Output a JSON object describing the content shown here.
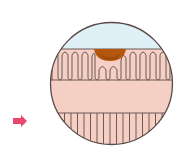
{
  "diagram": {
    "type": "tissue-cross-section-magnified",
    "colors": {
      "background": "#ffffff",
      "lumen": "#dff0f6",
      "tissue": "#f6cfc4",
      "outline": "#6b5a58",
      "lesion": "#b5560f",
      "lesion_dark": "#8a3f0a",
      "arrow": "#e8486e"
    },
    "circle": {
      "cx": 111.5,
      "cy": 83.5,
      "r": 61
    },
    "layers": [
      {
        "name": "lumen",
        "y_top": 22,
        "y_bottom": 49
      },
      {
        "name": "villi-layer",
        "y_top": 49,
        "y_bottom": 80
      },
      {
        "name": "submucosa",
        "y_top": 80,
        "y_bottom": 113
      },
      {
        "name": "muscle-layer",
        "y_top": 113,
        "y_bottom": 145
      }
    ],
    "lesion": {
      "x_left": 94,
      "x_right": 126,
      "y_top": 49,
      "y_bottom": 61
    },
    "arrow": {
      "x": 13,
      "y": 115,
      "width": 14,
      "height": 12,
      "direction": "right"
    }
  }
}
